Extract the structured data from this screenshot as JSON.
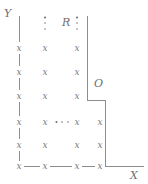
{
  "figure": {
    "background": "#ffffff",
    "stroke_color": "#8d8d8d",
    "mark_color": "#7a7a7a",
    "label_color": "#6e6e6e",
    "width": 148,
    "height": 184
  },
  "axes": {
    "y_label": "Y",
    "x_label": "X",
    "y_axis_x": 19,
    "x_axis_y": 166,
    "y_label_pos": {
      "x": 4,
      "y": 8
    },
    "x_label_pos": {
      "x": 130,
      "y": 170
    }
  },
  "labels": {
    "region": "R",
    "region_pos": {
      "x": 62,
      "y": 17
    },
    "corner": "O",
    "corner_pos": {
      "x": 94,
      "y": 78
    }
  },
  "boundary": {
    "upper_vertical_x": 87,
    "upper_vertical_top": 16,
    "upper_vertical_bottom": 100,
    "step_horizontal_y": 100,
    "step_horizontal_from": 87,
    "step_horizontal_to": 106,
    "lower_vertical_x": 105,
    "lower_vertical_top": 100,
    "lower_vertical_bottom": 166,
    "x_axis_from": 19,
    "x_axis_to": 144,
    "y_axis_top": 16,
    "y_axis_bottom": 166
  },
  "marks": {
    "glyph": "x",
    "columns": [
      19,
      45,
      77,
      100
    ],
    "rows": [
      48,
      72,
      96,
      122,
      145,
      166
    ],
    "points": [
      {
        "col": 0,
        "row": 0
      },
      {
        "col": 1,
        "row": 0
      },
      {
        "col": 2,
        "row": 0
      },
      {
        "col": 0,
        "row": 1
      },
      {
        "col": 1,
        "row": 1
      },
      {
        "col": 2,
        "row": 1
      },
      {
        "col": 0,
        "row": 2
      },
      {
        "col": 1,
        "row": 2
      },
      {
        "col": 2,
        "row": 2
      },
      {
        "col": 0,
        "row": 3
      },
      {
        "col": 1,
        "row": 3
      },
      {
        "col": 2,
        "row": 3
      },
      {
        "col": 3,
        "row": 3
      },
      {
        "col": 0,
        "row": 4
      },
      {
        "col": 1,
        "row": 4
      },
      {
        "col": 2,
        "row": 4
      },
      {
        "col": 3,
        "row": 4
      },
      {
        "col": 0,
        "row": 5
      },
      {
        "col": 1,
        "row": 5
      },
      {
        "col": 2,
        "row": 5
      },
      {
        "col": 3,
        "row": 5
      }
    ]
  },
  "ellipses": {
    "vertical": [
      {
        "x": 45,
        "y": 23
      },
      {
        "x": 77,
        "y": 23
      }
    ],
    "horizontal": [
      {
        "x": 62,
        "y": 122
      }
    ]
  },
  "connectors": {
    "vertical_segments": [
      {
        "x": 19,
        "y1": 16,
        "y2": 42
      },
      {
        "x": 19,
        "y1": 54,
        "y2": 66
      },
      {
        "x": 19,
        "y1": 78,
        "y2": 90
      },
      {
        "x": 19,
        "y1": 102,
        "y2": 116
      },
      {
        "x": 19,
        "y1": 128,
        "y2": 139
      },
      {
        "x": 19,
        "y1": 151,
        "y2": 161
      }
    ],
    "horizontal_segments": [
      {
        "y": 166,
        "x1": 24,
        "x2": 40
      },
      {
        "y": 166,
        "x1": 50,
        "x2": 72
      },
      {
        "y": 166,
        "x1": 82,
        "x2": 95
      },
      {
        "y": 166,
        "x1": 105,
        "x2": 144
      }
    ]
  }
}
